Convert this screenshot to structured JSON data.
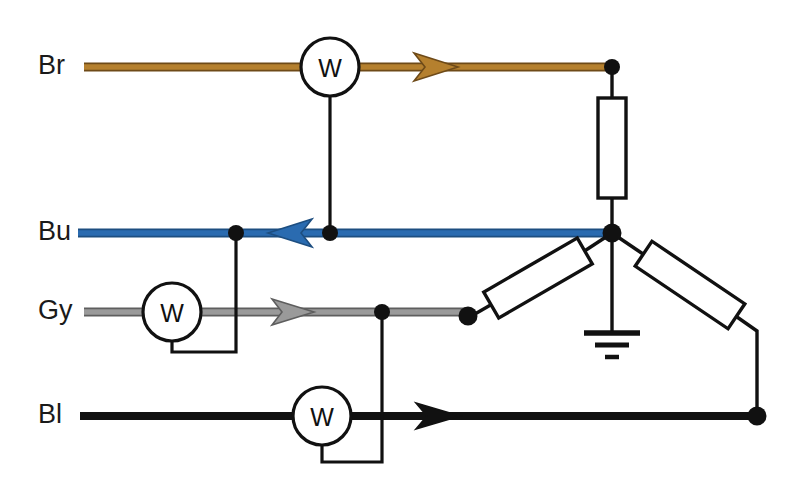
{
  "diagram": {
    "type": "electrical-schematic",
    "canvas": {
      "width": 792,
      "height": 484,
      "background": "#ffffff"
    },
    "colors": {
      "brown": "#B5802E",
      "brown_dark": "#6E4A18",
      "blue": "#2A6BB0",
      "blue_dark": "#1D4E80",
      "gray": "#9A9A9A",
      "gray_dark": "#5E5E5E",
      "black": "#111111",
      "stroke": "#111111",
      "fill": "#ffffff"
    },
    "phases": [
      {
        "id": "brown",
        "label": "Br",
        "label_x": 38,
        "label_y": 67,
        "wire_color": "#B5802E",
        "wire_edge": "#6E4A18",
        "y": 67,
        "x_start": 84,
        "x_end": 612,
        "arrow_x": 452,
        "arrow_dir": "right",
        "meter": {
          "label": "W",
          "cx": 330,
          "cy": 67,
          "r": 29
        }
      },
      {
        "id": "blue",
        "label": "Bu",
        "label_x": 38,
        "label_y": 233,
        "wire_color": "#2A6BB0",
        "wire_edge": "#1D4E80",
        "y": 233,
        "x_start": 78,
        "x_end": 612,
        "arrow_x": 290,
        "arrow_dir": "left",
        "meter": null
      },
      {
        "id": "gray",
        "label": "Gy",
        "label_x": 38,
        "label_y": 312,
        "wire_color": "#9A9A9A",
        "wire_edge": "#5E5E5E",
        "y": 312,
        "x_start": 84,
        "x_end": 468,
        "arrow_x": 307,
        "arrow_dir": "right",
        "meter": {
          "label": "W",
          "cx": 172,
          "cy": 312,
          "r": 29
        }
      },
      {
        "id": "black",
        "label": "Bl",
        "label_x": 38,
        "label_y": 416,
        "wire_color": "#111111",
        "wire_edge": "#111111",
        "y": 416,
        "x_start": 80,
        "x_end": 757,
        "arrow_x": 452,
        "arrow_dir": "right",
        "meter": {
          "label": "W",
          "cx": 322,
          "cy": 416,
          "r": 29
        }
      }
    ],
    "meters": [
      {
        "id": "wattmeter-brown",
        "label": "W",
        "phase": "Br",
        "cx": 330,
        "cy": 67,
        "r": 29,
        "voltage_coil": {
          "from_y": 96,
          "to_y": 233,
          "x": 330,
          "tap_node": "node-bu-mid"
        }
      },
      {
        "id": "wattmeter-gray",
        "label": "W",
        "phase": "Gy",
        "cx": 172,
        "cy": 312,
        "r": 29,
        "voltage_coil": {
          "drop_y": 352,
          "to_x": 236,
          "up_y": 233,
          "tap_node": "node-bu-left"
        }
      },
      {
        "id": "wattmeter-black",
        "label": "W",
        "phase": "Bl",
        "cx": 322,
        "cy": 416,
        "r": 29,
        "voltage_coil": {
          "drop_y": 462,
          "to_x": 382,
          "up_y": 312,
          "tap_node": "node-gy-mid"
        }
      }
    ],
    "nodes": [
      {
        "id": "node-br-right",
        "x": 612,
        "y": 67,
        "r": 8,
        "desc": "brown line end / top of vertical resistor"
      },
      {
        "id": "node-bu-left",
        "x": 236,
        "y": 233,
        "r": 8,
        "desc": "blue line tap for gray wattmeter coil"
      },
      {
        "id": "node-bu-mid",
        "x": 330,
        "y": 233,
        "r": 8,
        "desc": "blue line tap for brown wattmeter coil"
      },
      {
        "id": "node-star",
        "x": 612,
        "y": 233,
        "r": 9,
        "desc": "star point / neutral, grounded"
      },
      {
        "id": "node-gy-mid",
        "x": 382,
        "y": 312,
        "r": 8,
        "desc": "gray line tap for black wattmeter coil"
      },
      {
        "id": "node-gy-right",
        "x": 468,
        "y": 318,
        "r": 9,
        "desc": "gray line end / left diagonal resistor"
      },
      {
        "id": "node-bl-right",
        "x": 757,
        "y": 416,
        "r": 9,
        "desc": "black line end / right diagonal resistor"
      }
    ],
    "resistors": [
      {
        "id": "resistor-vertical",
        "orientation": "vertical",
        "x": 598,
        "y": 98,
        "width": 28,
        "height": 100,
        "angle": 0,
        "lead_from": {
          "x": 612,
          "y": 67
        },
        "lead_to": {
          "x": 612,
          "y": 233
        }
      },
      {
        "id": "resistor-diagonal-left",
        "orientation": "diagonal",
        "cx": 538,
        "cy": 278,
        "width": 108,
        "height": 30,
        "angle": -30,
        "lead_from": {
          "x": 468,
          "y": 318
        },
        "lead_to": {
          "x": 612,
          "y": 233
        }
      },
      {
        "id": "resistor-diagonal-right",
        "orientation": "diagonal",
        "cx": 690,
        "cy": 285,
        "width": 112,
        "height": 30,
        "angle": 34,
        "lead_from": {
          "x": 612,
          "y": 233
        },
        "lead_to": {
          "x": 757,
          "y": 416
        }
      }
    ],
    "ground": {
      "id": "ground-symbol",
      "x": 612,
      "stem_from_y": 233,
      "stem_to_y": 330,
      "bars": [
        {
          "y": 332,
          "half_width": 28,
          "thickness": 5
        },
        {
          "y": 344,
          "half_width": 17,
          "thickness": 5
        },
        {
          "y": 356,
          "half_width": 7,
          "thickness": 5
        }
      ]
    }
  }
}
